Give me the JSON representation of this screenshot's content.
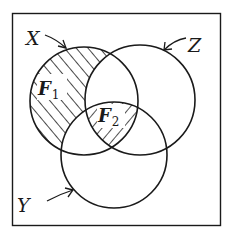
{
  "diagram": {
    "type": "venn",
    "sets": [
      {
        "id": "X",
        "label": "X",
        "cx": 84,
        "cy": 101,
        "r": 54
      },
      {
        "id": "Z",
        "label": "Z",
        "cx": 140,
        "cy": 100,
        "r": 55
      },
      {
        "id": "Y",
        "label": "Y",
        "cx": 114,
        "cy": 155,
        "r": 53
      }
    ],
    "regions": [
      {
        "id": "F1",
        "label": "F",
        "subscript": "1",
        "description": "X minus (Y union Z)",
        "hatch": "forward-slash"
      },
      {
        "id": "F2",
        "label": "F",
        "subscript": "2",
        "description": "X intersect Y intersect Z",
        "hatch": "back-slash"
      }
    ],
    "labels": {
      "x": "X",
      "y": "Y",
      "z": "Z",
      "f": "F",
      "f1_sub": "1",
      "f2_sub": "2"
    },
    "colors": {
      "ink": "#1a1a1a",
      "background": "#ffffff"
    }
  }
}
